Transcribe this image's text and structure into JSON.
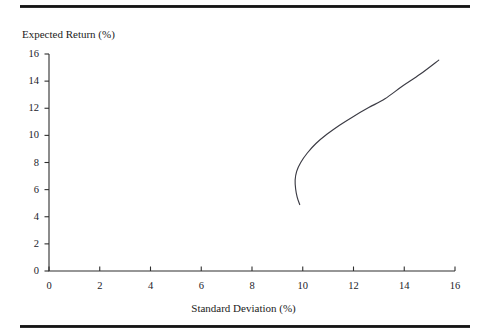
{
  "figure": {
    "background_color": "#ffffff",
    "rule_color": "#111111",
    "top_rule": "horizontal-rule",
    "bottom_rule": "horizontal-rule"
  },
  "chart_data": {
    "type": "line",
    "title": "",
    "subtitle": "",
    "xlabel": "Standard Deviation (%)",
    "ylabel": "Expected Return (%)",
    "xlim": [
      0,
      16
    ],
    "ylim": [
      0,
      16
    ],
    "xticks": [
      0,
      2,
      4,
      6,
      8,
      10,
      12,
      14,
      16
    ],
    "xtick_labels": [
      "0",
      "2",
      "4",
      "6",
      "8",
      "10",
      "12",
      "14",
      "16"
    ],
    "yticks": [
      0,
      2,
      4,
      6,
      8,
      10,
      12,
      14,
      16
    ],
    "ytick_labels": [
      "0",
      "2",
      "4",
      "6",
      "8",
      "10",
      "12",
      "14",
      "16"
    ],
    "grid": false,
    "legend": null,
    "legend_position": "none",
    "annotations": [],
    "series": [
      {
        "name": "Efficient frontier",
        "color": "#3b3b44",
        "line_width": 1.15,
        "marker": "none",
        "x": [
          9.88,
          9.78,
          9.72,
          9.7,
          9.76,
          9.92,
          10.18,
          10.52,
          10.95,
          11.45,
          12.0,
          12.6,
          13.24,
          13.92,
          14.62,
          15.36
        ],
        "y": [
          4.9,
          5.45,
          6.05,
          6.7,
          7.35,
          8.0,
          8.7,
          9.4,
          10.08,
          10.75,
          11.4,
          12.05,
          12.7,
          13.62,
          14.5,
          15.55
        ]
      }
    ]
  }
}
